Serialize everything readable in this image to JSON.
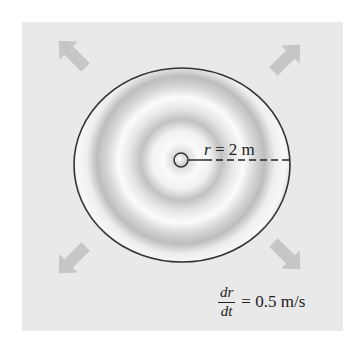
{
  "figure": {
    "colors": {
      "background": "#ffffff",
      "panel": "#e9e9e9",
      "disc_fill": "#f3f3f3",
      "ring_shade": "#b5b5b5",
      "outline": "#333333",
      "arrow": "#c6c6c6",
      "text": "#222222"
    },
    "radius_label": {
      "variable": "r",
      "equals": " = ",
      "value": "2 m"
    },
    "rate_label": {
      "numerator": "dr",
      "denominator": "dt",
      "equals": "= ",
      "value": "0.5 m/s"
    },
    "arrows": [
      {
        "name": "arrow-up-left",
        "direction": "northwest"
      },
      {
        "name": "arrow-up-right",
        "direction": "northeast"
      },
      {
        "name": "arrow-down-left",
        "direction": "southwest"
      },
      {
        "name": "arrow-down-right",
        "direction": "southeast"
      }
    ]
  }
}
